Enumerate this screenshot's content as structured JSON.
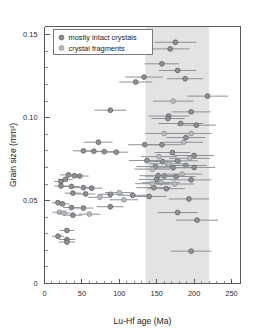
{
  "chart_data": {
    "type": "scatter",
    "title": "",
    "xlabel": "Lu-Hf age (Ma)",
    "ylabel": "Grain size (mm²)",
    "xlim": [
      0,
      262
    ],
    "ylim": [
      0,
      0.155
    ],
    "xticks": [
      0,
      50,
      100,
      150,
      200,
      250
    ],
    "xtick_labels": [
      "0",
      "50",
      "100",
      "150",
      "200",
      "250"
    ],
    "yticks": [
      0,
      0.05,
      0.1,
      0.15
    ],
    "ytick_labels": [
      "0",
      "0.05",
      "0.10",
      "0.15"
    ],
    "y_minor_step": 0.01,
    "x_minor_step": 10,
    "grid": false,
    "legend_position": "upper-left",
    "shaded_band": {
      "label": "",
      "x_start": 135,
      "x_end": 220,
      "color": "#e3e3e3"
    },
    "legend": [
      {
        "name": "mostly intact crystals",
        "marker": "circle",
        "color": "#8e9296"
      },
      {
        "name": "crystal fragments",
        "marker": "circle",
        "color": "#b9bcbf"
      }
    ],
    "series": [
      {
        "name": "mostly intact crystals",
        "color": "#8e9296",
        "points": [
          {
            "x": 175,
            "y": 0.1455,
            "xerr": 28
          },
          {
            "x": 168,
            "y": 0.1415,
            "xerr": 26
          },
          {
            "x": 157,
            "y": 0.1325,
            "xerr": 23
          },
          {
            "x": 178,
            "y": 0.1285,
            "xerr": 25
          },
          {
            "x": 133,
            "y": 0.1245,
            "xerr": 25
          },
          {
            "x": 122,
            "y": 0.1215,
            "xerr": 22
          },
          {
            "x": 188,
            "y": 0.1235,
            "xerr": 24
          },
          {
            "x": 218,
            "y": 0.113,
            "xerr": 27
          },
          {
            "x": 88,
            "y": 0.1045,
            "xerr": 21
          },
          {
            "x": 166,
            "y": 0.101,
            "xerr": 27
          },
          {
            "x": 196,
            "y": 0.1035,
            "xerr": 26
          },
          {
            "x": 165,
            "y": 0.0995,
            "xerr": 22
          },
          {
            "x": 182,
            "y": 0.0965,
            "xerr": 30
          },
          {
            "x": 203,
            "y": 0.0955,
            "xerr": 26
          },
          {
            "x": 72,
            "y": 0.0852,
            "xerr": 19
          },
          {
            "x": 134,
            "y": 0.0837,
            "xerr": 22
          },
          {
            "x": 157,
            "y": 0.0837,
            "xerr": 26
          },
          {
            "x": 189,
            "y": 0.088,
            "xerr": 26
          },
          {
            "x": 52,
            "y": 0.08,
            "xerr": 14
          },
          {
            "x": 66,
            "y": 0.0798,
            "xerr": 17
          },
          {
            "x": 80,
            "y": 0.0795,
            "xerr": 16
          },
          {
            "x": 96,
            "y": 0.0792,
            "xerr": 16
          },
          {
            "x": 171,
            "y": 0.079,
            "xerr": 24
          },
          {
            "x": 200,
            "y": 0.0772,
            "xerr": 27
          },
          {
            "x": 137,
            "y": 0.0742,
            "xerr": 24
          },
          {
            "x": 158,
            "y": 0.0735,
            "xerr": 25
          },
          {
            "x": 178,
            "y": 0.074,
            "xerr": 27
          },
          {
            "x": 189,
            "y": 0.0712,
            "xerr": 28
          },
          {
            "x": 148,
            "y": 0.0705,
            "xerr": 25
          },
          {
            "x": 172,
            "y": 0.0698,
            "xerr": 26
          },
          {
            "x": 200,
            "y": 0.07,
            "xerr": 28
          },
          {
            "x": 32,
            "y": 0.0655,
            "xerr": 11
          },
          {
            "x": 40,
            "y": 0.065,
            "xerr": 11
          },
          {
            "x": 47,
            "y": 0.0648,
            "xerr": 12
          },
          {
            "x": 152,
            "y": 0.065,
            "xerr": 25
          },
          {
            "x": 160,
            "y": 0.0648,
            "xerr": 26
          },
          {
            "x": 176,
            "y": 0.0645,
            "xerr": 26
          },
          {
            "x": 28,
            "y": 0.0628,
            "xerr": 10
          },
          {
            "x": 22,
            "y": 0.0615,
            "xerr": 9
          },
          {
            "x": 150,
            "y": 0.0628,
            "xerr": 24
          },
          {
            "x": 196,
            "y": 0.0625,
            "xerr": 27
          },
          {
            "x": 22,
            "y": 0.0588,
            "xerr": 9
          },
          {
            "x": 36,
            "y": 0.0585,
            "xerr": 11
          },
          {
            "x": 52,
            "y": 0.0578,
            "xerr": 13
          },
          {
            "x": 63,
            "y": 0.0575,
            "xerr": 14
          },
          {
            "x": 146,
            "y": 0.0578,
            "xerr": 23
          },
          {
            "x": 163,
            "y": 0.0572,
            "xerr": 25
          },
          {
            "x": 38,
            "y": 0.0545,
            "xerr": 11
          },
          {
            "x": 55,
            "y": 0.054,
            "xerr": 13
          },
          {
            "x": 88,
            "y": 0.0538,
            "xerr": 17
          },
          {
            "x": 118,
            "y": 0.0532,
            "xerr": 20
          },
          {
            "x": 140,
            "y": 0.0525,
            "xerr": 23
          },
          {
            "x": 193,
            "y": 0.051,
            "xerr": 27
          },
          {
            "x": 18,
            "y": 0.0487,
            "xerr": 8
          },
          {
            "x": 24,
            "y": 0.048,
            "xerr": 9
          },
          {
            "x": 36,
            "y": 0.0458,
            "xerr": 11
          },
          {
            "x": 52,
            "y": 0.0455,
            "xerr": 13
          },
          {
            "x": 88,
            "y": 0.0463,
            "xerr": 18
          },
          {
            "x": 178,
            "y": 0.0428,
            "xerr": 27
          },
          {
            "x": 38,
            "y": 0.0412,
            "xerr": 12
          },
          {
            "x": 204,
            "y": 0.0382,
            "xerr": 28
          },
          {
            "x": 30,
            "y": 0.032,
            "xerr": 10
          },
          {
            "x": 18,
            "y": 0.0285,
            "xerr": 8
          },
          {
            "x": 30,
            "y": 0.0265,
            "xerr": 11
          },
          {
            "x": 30,
            "y": 0.025,
            "xerr": 11
          },
          {
            "x": 196,
            "y": 0.0195,
            "xerr": 27
          }
        ]
      },
      {
        "name": "crystal fragments",
        "color": "#b9bcbf",
        "points": [
          {
            "x": 172,
            "y": 0.11,
            "xerr": 27
          },
          {
            "x": 160,
            "y": 0.0905,
            "xerr": 25
          },
          {
            "x": 196,
            "y": 0.0905,
            "xerr": 27
          },
          {
            "x": 186,
            "y": 0.0852,
            "xerr": 26
          },
          {
            "x": 153,
            "y": 0.0765,
            "xerr": 24
          },
          {
            "x": 194,
            "y": 0.0755,
            "xerr": 27
          },
          {
            "x": 166,
            "y": 0.0722,
            "xerr": 26
          },
          {
            "x": 144,
            "y": 0.069,
            "xerr": 24
          },
          {
            "x": 184,
            "y": 0.066,
            "xerr": 27
          },
          {
            "x": 156,
            "y": 0.0608,
            "xerr": 25
          },
          {
            "x": 174,
            "y": 0.06,
            "xerr": 26
          },
          {
            "x": 100,
            "y": 0.0548,
            "xerr": 19
          },
          {
            "x": 74,
            "y": 0.052,
            "xerr": 16
          },
          {
            "x": 106,
            "y": 0.0505,
            "xerr": 19
          },
          {
            "x": 144,
            "y": 0.0602,
            "xerr": 23
          },
          {
            "x": 20,
            "y": 0.043,
            "xerr": 9
          },
          {
            "x": 26,
            "y": 0.0425,
            "xerr": 9
          },
          {
            "x": 60,
            "y": 0.0418,
            "xerr": 14
          }
        ]
      }
    ]
  }
}
